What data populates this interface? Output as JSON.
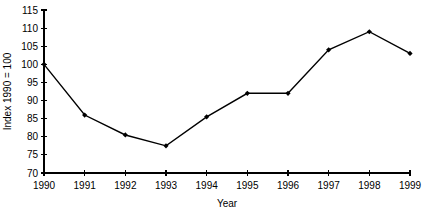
{
  "chart_data": {
    "type": "line",
    "title": "",
    "xlabel": "Year",
    "ylabel": "Index 1990 = 100",
    "categories": [
      "1990",
      "1991",
      "1992",
      "1993",
      "1994",
      "1995",
      "1996",
      "1997",
      "1998",
      "1999"
    ],
    "x": [
      1990,
      1991,
      1992,
      1993,
      1994,
      1995,
      1996,
      1997,
      1998,
      1999
    ],
    "values": [
      100,
      86,
      80.5,
      77.5,
      85.5,
      92,
      92,
      104,
      109,
      103
    ],
    "series": [
      {
        "name": "Index",
        "values": [
          100,
          86,
          80.5,
          77.5,
          85.5,
          92,
          92,
          104,
          109,
          103
        ]
      }
    ],
    "ylim": [
      70,
      115
    ],
    "yticks": [
      70,
      75,
      80,
      85,
      90,
      95,
      100,
      105,
      110,
      115
    ],
    "ytick_labels": [
      "70",
      "75",
      "80",
      "85",
      "90",
      "95",
      "100",
      "105",
      "110",
      "115"
    ],
    "xlim": [
      1990,
      1999
    ],
    "xticks": [
      1990,
      1991,
      1992,
      1993,
      1994,
      1995,
      1996,
      1997,
      1998,
      1999
    ],
    "xtick_labels": [
      "1990",
      "1991",
      "1992",
      "1993",
      "1994",
      "1995",
      "1996",
      "1997",
      "1998",
      "1999"
    ],
    "grid": false,
    "legend": false,
    "legend_position": "none",
    "marker": "diamond",
    "line_color": "#000000",
    "marker_color": "#000000",
    "background_color": "#ffffff"
  }
}
